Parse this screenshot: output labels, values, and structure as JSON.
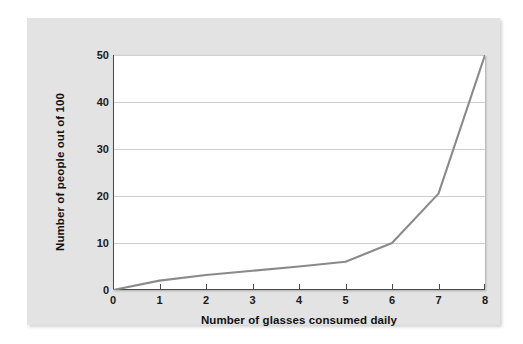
{
  "chart_data": {
    "type": "line",
    "title": "",
    "xlabel": "Number of glasses consumed daily",
    "ylabel": "Number of people out of 100",
    "xlim": [
      0,
      8
    ],
    "ylim": [
      0,
      50
    ],
    "xticks": [
      0,
      1,
      2,
      3,
      4,
      5,
      6,
      7,
      8
    ],
    "yticks": [
      0,
      10,
      20,
      30,
      40,
      50
    ],
    "grid": "horizontal",
    "legend": "none",
    "line_color": "#8a8a8a",
    "plot_background": "#ffffff",
    "panel_background": "#e3e3e3",
    "x": [
      0,
      1,
      2,
      3,
      4,
      5,
      6,
      7,
      8
    ],
    "values": [
      0,
      2,
      3.2,
      4.1,
      5,
      6,
      10,
      20.5,
      50
    ],
    "series": [
      {
        "name": "People out of 100",
        "values": [
          0,
          2,
          3.2,
          4.1,
          5,
          6,
          10,
          20.5,
          50
        ]
      }
    ]
  }
}
